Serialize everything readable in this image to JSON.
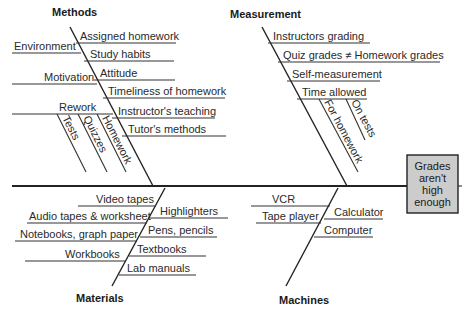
{
  "effect": {
    "lines": [
      "Grades",
      "aren't",
      "high",
      "enough"
    ],
    "box_color": "#cccccc"
  },
  "categories": {
    "methods": {
      "label": "Methods",
      "causes_right": [
        "Assigned homework",
        "Study habits",
        "Attitude",
        "Timeliness of homework",
        "Instructor's teaching",
        "Tutor's methods"
      ],
      "causes_left": [
        "Environment",
        "Motivation",
        "Rework"
      ],
      "rework_subcauses": [
        "Tests",
        "Quizzes",
        "Homework"
      ]
    },
    "measurement": {
      "label": "Measurement",
      "causes": [
        "Instructors grading",
        "Quiz grades ≠ Homework grades",
        "Self-measurement",
        "Time allowed"
      ],
      "time_allowed_subcauses": [
        "For homework",
        "On tests"
      ]
    },
    "materials": {
      "label": "Materials",
      "causes_left": [
        "Video tapes",
        "Audio tapes & worksheet",
        "Notebooks, graph paper",
        "Workbooks"
      ],
      "causes_right": [
        "Highlighters",
        "Pens, pencils",
        "Textbooks",
        "Lab manuals"
      ]
    },
    "machines": {
      "label": "Machines",
      "causes_left": [
        "VCR",
        "Tape player"
      ],
      "causes_right": [
        "Calculator",
        "Computer"
      ]
    }
  }
}
